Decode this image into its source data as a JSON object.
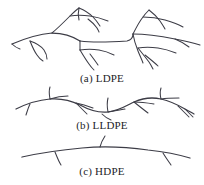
{
  "figure": {
    "background_color": "#ffffff",
    "stroke_color": "#3c3c46",
    "text_color": "#232327",
    "width": 204,
    "height": 185
  },
  "panels": [
    {
      "id": "ldpe",
      "caption": "(a) LDPE",
      "caption_x": 102,
      "caption_y": 82,
      "description": "Highly branched chain with long and short branches",
      "branch_count": 18
    },
    {
      "id": "lldpe",
      "caption": "(b) LLDPE",
      "caption_x": 102,
      "caption_y": 129,
      "description": "Linear wavy chain with regular short branches",
      "branch_count": 8
    },
    {
      "id": "hdpe",
      "caption": "(c) HDPE",
      "caption_x": 102,
      "caption_y": 175,
      "description": "Essentially linear chain with very few short branches",
      "branch_count": 3
    }
  ],
  "strokes": {
    "ldpe": [
      "M 12 44 C 26 38 40 34 52 33 C 66 33 74 37 80 41",
      "M 80 41 C 94 43 112 42 127 41 C 131 40 133 37 133 34",
      "M 133 34 C 145 34 160 36 175 39 C 186 41 194 43 200 45",
      "M 52 33 C 58 28 64 22 70 16 C 73 13 76 10 79 8",
      "M 79 8 C 84 10 89 13 93 17 C 96 20 98 23 100 26",
      "M 70 16 C 76 15 83 15 90 16 C 97 17 103 19 108 21",
      "M 88 19 C 92 22 95 25 97 28 C 98 30 99 31 99 32",
      "M 79 8 C 78 12 78 16 79 20",
      "M 12 44 C 14 46 17 48 20 49",
      "M 30 41 C 32 46 34 51 37 55 C 39 58 41 60 43 61",
      "M 30 41 C 36 43 41 46 44 50 C 46 53 47 56 47 59",
      "M 80 41 L 80 50",
      "M 80 50 C 86 49 93 49 99 50 C 105 51 110 53 114 55",
      "M 80 50 C 83 55 86 60 89 64 C 91 67 93 69 94 70",
      "M 90 54 C 93 58 96 62 98 65",
      "M 133 34 C 136 28 139 22 143 17 C 145 14 147 12 149 10",
      "M 149 10 C 153 13 157 17 160 21 C 162 24 164 27 165 29",
      "M 143 17 C 150 17 158 18 165 20 C 172 22 178 24 183 27",
      "M 133 34 C 134 40 136 46 138 51 C 140 56 142 60 143 63",
      "M 138 48 C 144 47 151 47 158 48 C 165 49 171 51 176 53",
      "M 138 48 C 142 53 146 58 149 62 C 151 65 152 67 153 69",
      "M 145 55 C 150 59 155 63 158 66",
      "M 175 39 C 180 41 185 44 189 47"
    ],
    "lldpe": [
      "M 16 109 C 26 104 38 100 50 99 C 62 98 72 101 80 105 C 89 110 98 113 108 112 C 118 111 126 106 134 102 C 143 98 152 97 161 99 C 170 101 178 105 185 109 C 189 111 192 113 194 114",
      "M 50 99 C 49 94 49 90 50 87",
      "M 50 99 C 56 97 62 96 68 96",
      "M 30 104 C 28 108 27 112 26 115",
      "M 76 103 C 80 107 84 111 87 114",
      "M 76 103 C 82 104 88 106 93 108",
      "M 108 112 C 107 107 107 102 108 98",
      "M 108 112 C 114 111 120 110 125 109",
      "M 102 114 C 105 117 108 119 111 120",
      "M 134 102 C 139 106 144 110 148 113",
      "M 134 102 C 141 102 148 103 154 104",
      "M 161 99 C 160 95 160 91 161 88",
      "M 161 99 C 167 98 173 98 179 98",
      "M 185 109 C 188 112 191 115 193 117",
      "M 178 106 C 182 110 186 114 189 117"
    ],
    "hdpe": [
      "M 22 157 C 40 153 60 150 82 148 C 104 146 126 147 148 150 C 166 152 180 155 190 158",
      "M 55 152 C 57 157 59 162 61 165",
      "M 100 147 C 101 143 103 139 105 136",
      "M 163 153 C 166 158 169 162 171 165"
    ]
  }
}
